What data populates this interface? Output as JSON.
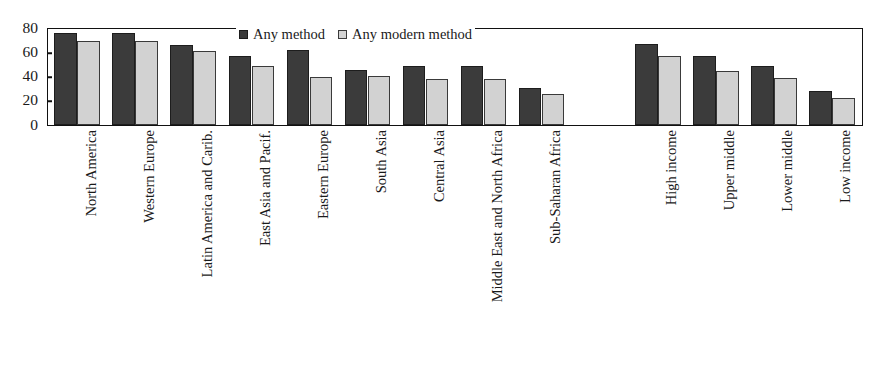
{
  "chart_data": {
    "type": "bar",
    "title": "",
    "subtitle": "",
    "xlabel": "",
    "ylabel": "",
    "ylim": [
      0,
      80
    ],
    "yticks": [
      0,
      20,
      40,
      60,
      80
    ],
    "grid": false,
    "legend_position": "top-center",
    "categories": [
      "North America",
      "Western Europe",
      "Latin America and Carib.",
      "East Asia and Pacif.",
      "Eastern Europe",
      "South Asia",
      "Central Asia",
      "Middle East and North Africa",
      "Sub-Saharan Africa",
      "",
      "High income",
      "Upper middle",
      "Lower middle",
      "Low income"
    ],
    "series": [
      {
        "name": "Any method",
        "color": "#3b3b3b",
        "values": [
          76,
          76,
          66,
          57,
          62,
          46,
          49,
          49,
          31,
          null,
          67,
          57,
          49,
          28
        ]
      },
      {
        "name": "Any modern method",
        "color": "#d2d2d2",
        "values": [
          70,
          70,
          61,
          49,
          40,
          41,
          38,
          38,
          26,
          null,
          57,
          45,
          39,
          22
        ]
      }
    ]
  },
  "legend": {
    "entries": [
      {
        "label": "Any method",
        "swatch": "dark-square-swatch"
      },
      {
        "label": "Any modern method",
        "swatch": "light-square-swatch"
      }
    ]
  },
  "axes": {
    "y_tick_labels": [
      "0",
      "20",
      "40",
      "60",
      "80"
    ]
  },
  "colors": {
    "series_any_method": "#3b3b3b",
    "series_any_modern_method": "#d2d2d2",
    "axis": "#111111",
    "background": "#ffffff"
  }
}
